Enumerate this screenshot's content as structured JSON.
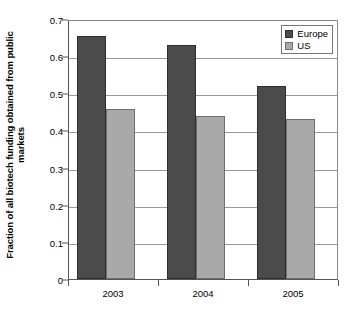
{
  "chart_data": {
    "type": "bar",
    "title": "",
    "subtitle": "",
    "xlabel": "",
    "ylabel": "Fraction of all biotech funding obtained from public markets",
    "ylabel_lines": [
      "Fraction of all biotech funding obtained from public",
      "markets"
    ],
    "categories": [
      "2003",
      "2004",
      "2005"
    ],
    "series": [
      {
        "name": "Europe",
        "color": "#4b4b4b",
        "values": [
          0.655,
          0.63,
          0.52
        ]
      },
      {
        "name": "US",
        "color": "#a9a9a9",
        "values": [
          0.458,
          0.44,
          0.43
        ]
      }
    ],
    "ylim": [
      0,
      0.7
    ],
    "ytick_values": [
      0,
      0.1,
      0.2,
      0.3,
      0.4,
      0.5,
      0.6,
      0.7
    ],
    "ytick_labels": [
      "0",
      "0.1",
      "0.2",
      "0.3",
      "0.4",
      "0.5",
      "0.6",
      "0.7"
    ],
    "grid": true,
    "grid_axis": "y",
    "legend_position": "top-right",
    "legend_entries": [
      "Europe",
      "US"
    ]
  },
  "legend": {
    "items": [
      {
        "label": "Europe",
        "swatch": "legend-swatch-europe"
      },
      {
        "label": "US",
        "swatch": "legend-swatch-us"
      }
    ]
  }
}
